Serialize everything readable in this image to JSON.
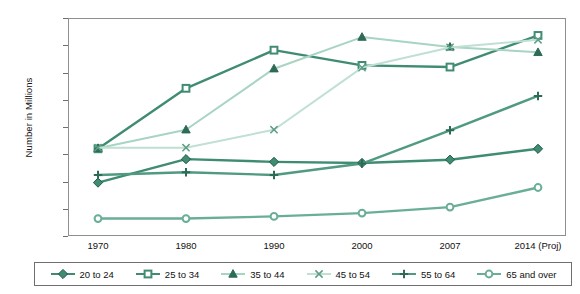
{
  "chart_data": {
    "type": "line",
    "title": "",
    "xlabel": "",
    "ylabel": "Number in Millions",
    "categories": [
      "1970",
      "1980",
      "1990",
      "2000",
      "2007",
      "2014 (Proj)"
    ],
    "ylim": [
      0,
      40000
    ],
    "ytick_step": 5000,
    "yticks": [
      "0",
      "5,000",
      "10,000",
      "15,000",
      "20,000",
      "25,000",
      "30,000",
      "35,000",
      "40,000"
    ],
    "ytick_values": [
      0,
      5000,
      10000,
      15000,
      20000,
      25000,
      30000,
      35000,
      40000
    ],
    "grid": false,
    "legend_position": "bottom",
    "series": [
      {
        "name": "20 to 24",
        "marker": "diamond",
        "color": "#3f8c72",
        "values": [
          9800,
          14100,
          13600,
          13400,
          14000,
          16000
        ]
      },
      {
        "name": "25 to 34",
        "marker": "square",
        "color": "#3f8c72",
        "values": [
          16000,
          27100,
          34100,
          31300,
          31000,
          36800
        ]
      },
      {
        "name": "35 to 44",
        "marker": "triangle",
        "color": "#a8d4c2",
        "values": [
          16100,
          19500,
          30700,
          36500,
          34700,
          33700
        ]
      },
      {
        "name": "45 to 54",
        "marker": "x",
        "color": "#bfe0d2",
        "values": [
          16200,
          16200,
          19500,
          30900,
          34600,
          36000
        ]
      },
      {
        "name": "55 to 64",
        "marker": "plus",
        "color": "#4f9a80",
        "values": [
          11200,
          11700,
          11200,
          13300,
          19400,
          25700
        ]
      },
      {
        "name": "65 and over",
        "marker": "circle",
        "color": "#6aaf95",
        "values": [
          3200,
          3200,
          3600,
          4200,
          5300,
          8900
        ]
      }
    ]
  },
  "legend": {
    "items": [
      {
        "label": "20 to 24"
      },
      {
        "label": "25 to 34"
      },
      {
        "label": "35 to 44"
      },
      {
        "label": "45 to 54"
      },
      {
        "label": "55 to 64"
      },
      {
        "label": "65 and over"
      }
    ]
  }
}
